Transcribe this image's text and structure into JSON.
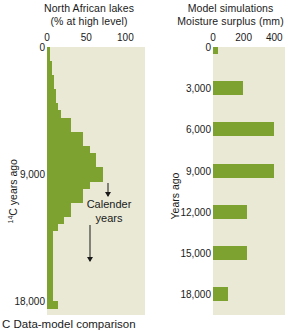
{
  "figure": {
    "caption": "C Data-model comparison"
  },
  "left_panel": {
    "title_line1": "North African lakes",
    "title_line2": "(% at high level)",
    "y_axis_title_pre": "14",
    "y_axis_title": "C years ago",
    "annotation_line1": "Calender",
    "annotation_line2": "years"
  },
  "right_panel": {
    "title_line1": "Model simulations",
    "title_line2": "Moisture surplus (mm)",
    "y_axis_title": "Years ago"
  },
  "colors": {
    "bar": "#7ea22f",
    "plot_background": "#e9e9d6",
    "text": "#1a1a1a",
    "page_background": "#ffffff"
  },
  "chart_data": [
    {
      "type": "bar",
      "orientation": "horizontal",
      "title": "North African lakes (% at high level)",
      "xlabel": "% at high level",
      "ylabel": "14C years ago",
      "xlim": [
        0,
        125
      ],
      "ylim": [
        0,
        19000
      ],
      "y_inverted": true,
      "xticks": [
        0,
        50,
        100
      ],
      "xticklabels": [
        "0",
        "50",
        "100"
      ],
      "yticks": [
        0,
        9000,
        18000
      ],
      "yticklabels": [
        "0",
        "9,000",
        "18,000"
      ],
      "grid": false,
      "legend": "none",
      "bin_width_years": 500,
      "categories": [
        0,
        500,
        1000,
        1500,
        2000,
        2500,
        3000,
        3500,
        4000,
        4500,
        5000,
        5500,
        6000,
        6500,
        7000,
        7500,
        8000,
        8500,
        9000,
        9500,
        10000,
        10500,
        11000,
        11500,
        12000,
        12500,
        13000,
        13500,
        14000,
        14500,
        15000,
        15500,
        16000,
        16500,
        17000,
        17500,
        18000
      ],
      "values": [
        4,
        4,
        6,
        6,
        9,
        9,
        12,
        12,
        14,
        18,
        30,
        30,
        46,
        46,
        55,
        62,
        62,
        72,
        72,
        55,
        46,
        46,
        30,
        30,
        22,
        14,
        8,
        8,
        8,
        8,
        8,
        8,
        8,
        8,
        8,
        8,
        14
      ]
    },
    {
      "type": "bar",
      "orientation": "horizontal",
      "title": "Model simulations — Moisture surplus (mm)",
      "xlabel": "Moisture surplus (mm)",
      "ylabel": "Years ago",
      "xlim": [
        0,
        470
      ],
      "ylim": [
        0,
        19500
      ],
      "y_inverted": true,
      "xticks": [
        0,
        200,
        400
      ],
      "xticklabels": [
        "0",
        "200",
        "400"
      ],
      "yticks": [
        0,
        3000,
        6000,
        9000,
        12000,
        15000,
        18000
      ],
      "yticklabels": [
        "0",
        "3,000",
        "6,000",
        "9,000",
        "12,000",
        "15,000",
        "18,000"
      ],
      "grid": false,
      "legend": "none",
      "categories": [
        0,
        3000,
        6000,
        9000,
        12000,
        15000,
        18000
      ],
      "values": [
        30,
        195,
        400,
        395,
        220,
        225,
        100
      ]
    }
  ]
}
